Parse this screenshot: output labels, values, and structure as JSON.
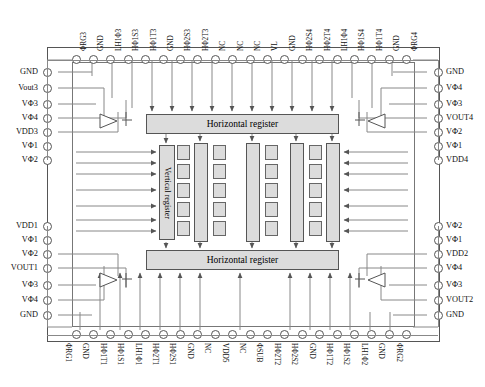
{
  "diagram": {
    "blocks": {
      "horizontal_register_top": "Horizontal register",
      "horizontal_register_bottom": "Horizontal register",
      "vertical_register": "Vertical register"
    },
    "colors": {
      "block_fill": "#dcdcdc",
      "outline": "#555555",
      "wire": "#888888",
      "text": "#111111"
    },
    "pins": {
      "top": [
        "ΦRG3",
        "GND",
        "LH1Φ3",
        "HΦ1S3",
        "HΦ1T3",
        "GND",
        "HΦ2S3",
        "HΦ2T3",
        "NC",
        "NC",
        "NC",
        "VL",
        "GND",
        "HΦ2S4",
        "HΦ2T4",
        "LH1Φ4",
        "HΦ1S4",
        "HΦ1T4",
        "GND",
        "ΦRG4"
      ],
      "bottom": [
        "ΦRG1",
        "GND",
        "HΦ1T1",
        "HΦ1S1",
        "LH1Φ1",
        "HΦ2T1",
        "HΦ2S1",
        "GND",
        "NC",
        "VDD5",
        "NC",
        "ΦSUB",
        "HΦ2T2",
        "HΦ2S2",
        "GND",
        "HΦ1T2",
        "HΦ1S2",
        "LH1Φ2",
        "GND",
        "ΦRG2"
      ],
      "left": [
        "GND",
        "Vout3",
        "VΦ3",
        "VΦ4",
        "VDD3",
        "VΦ1",
        "VΦ2",
        "VDD1",
        "VΦ1",
        "VΦ2",
        "VOUT1",
        "VΦ3",
        "VΦ4",
        "GND"
      ],
      "right": [
        "GND",
        "VΦ4",
        "VΦ3",
        "VOUT4",
        "VΦ2",
        "VΦ1",
        "VDD4",
        "VΦ2",
        "VΦ1",
        "VDD2",
        "VΦ4",
        "VΦ3",
        "VOUT2",
        "GND"
      ]
    }
  }
}
